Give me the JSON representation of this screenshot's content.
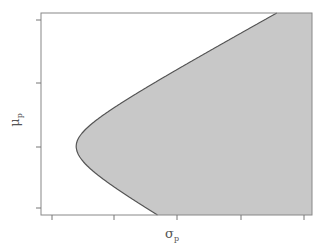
{
  "chart_data": {
    "type": "area",
    "title": "",
    "xlabel": "σ",
    "xlabel_subscript": "p",
    "ylabel": "μ",
    "ylabel_subscript": "p",
    "x_ticks_count": 5,
    "y_ticks_count": 4,
    "x_tick_labels": [],
    "y_tick_labels": [],
    "grid": false,
    "legend": null,
    "frontier": {
      "shape": "hyperbola",
      "vertex_relative": {
        "x": 0.13,
        "y": 0.66
      },
      "top_intersection_x_relative": 0.87,
      "bottom_intersection_x_relative": 0.43
    },
    "colors": {
      "fill": "#c8c8c8",
      "curve": "#555555",
      "axis": "#777777"
    }
  }
}
